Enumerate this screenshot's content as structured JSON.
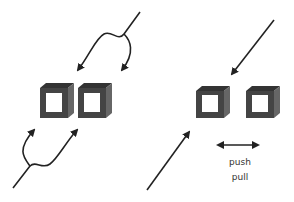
{
  "diagram": {
    "left_panel": {
      "description": "two channels with split input and output flows"
    },
    "right_panel": {
      "description": "two channels with single flow",
      "labels": {
        "line1": "push",
        "line2": "pull"
      }
    },
    "colors": {
      "box_dark": "#3a3a3a",
      "box_mid": "#555555",
      "box_light": "#707070",
      "arrow": "#222222"
    }
  }
}
